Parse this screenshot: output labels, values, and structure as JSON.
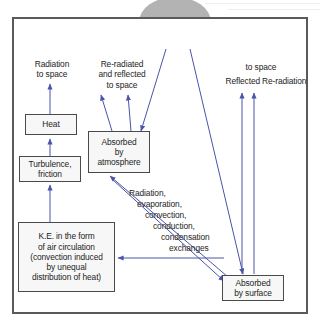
{
  "diagram": {
    "colors": {
      "frame_border": "#5a5a5a",
      "box_border": "#4a4a4a",
      "box_fill": "#f7f7f7",
      "arrow": "#4a54a8",
      "sun_fill": "#b3b3b3",
      "ray_fill": "#cfcfcf",
      "text": "#1d1d1d",
      "background": "#ffffff"
    },
    "sun": {
      "label": "Solar\nenergy"
    },
    "nodes": [
      {
        "id": "heat",
        "label": "Heat"
      },
      {
        "id": "turbulence",
        "label": "Turbulence,\nfriction"
      },
      {
        "id": "ke",
        "label": "K.E. in the form\nof air circulation\n(convection induced\nby unequal\ndistribution of heat)"
      },
      {
        "id": "atmosphere",
        "label": "Absorbed\nby\natmosphere"
      },
      {
        "id": "surface",
        "label": "Absorbed\nby surface"
      }
    ],
    "captions": {
      "radiation_to_space": "Radiation\nto space",
      "re_radiated_reflected": "Re-radiated\nand reflected\nto space",
      "to_space": "to space",
      "reflected": "Reflected",
      "re_radiation": "Re-radiation"
    },
    "exchanges": {
      "lines": [
        "Radiation,",
        "evaporation,",
        "convection,",
        "conduction,",
        "condensation",
        "exchanges"
      ]
    }
  }
}
